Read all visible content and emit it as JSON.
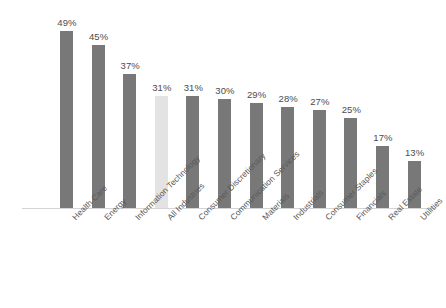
{
  "chart_data": {
    "type": "bar",
    "title": "",
    "subtitle": "",
    "xlabel": "",
    "ylabel": "",
    "ylim": [
      0,
      55
    ],
    "grid": false,
    "legend": "none",
    "value_suffix": "%",
    "categories": [
      "Health Care",
      "Energy",
      "Information Technology",
      "All Industries",
      "Consumer Discretionary",
      "Communication Services",
      "Materials",
      "Industrials",
      "Consumer Staples",
      "Financials",
      "Real Estate",
      "Utilities"
    ],
    "values": [
      49,
      45,
      37,
      31,
      31,
      30,
      29,
      28,
      27,
      25,
      17,
      13
    ],
    "value_labels": [
      "49%",
      "45%",
      "37%",
      "31%",
      "31%",
      "30%",
      "29%",
      "28%",
      "27%",
      "25%",
      "17%",
      "13%"
    ],
    "highlight_index": 3,
    "colors": {
      "bar": "#787878",
      "highlight_bar": "#e3e3e3",
      "value_label": "#4c4c4c",
      "category_label": "#585858",
      "axis_line": "#d4d4d4",
      "background": "#ffffff"
    }
  }
}
